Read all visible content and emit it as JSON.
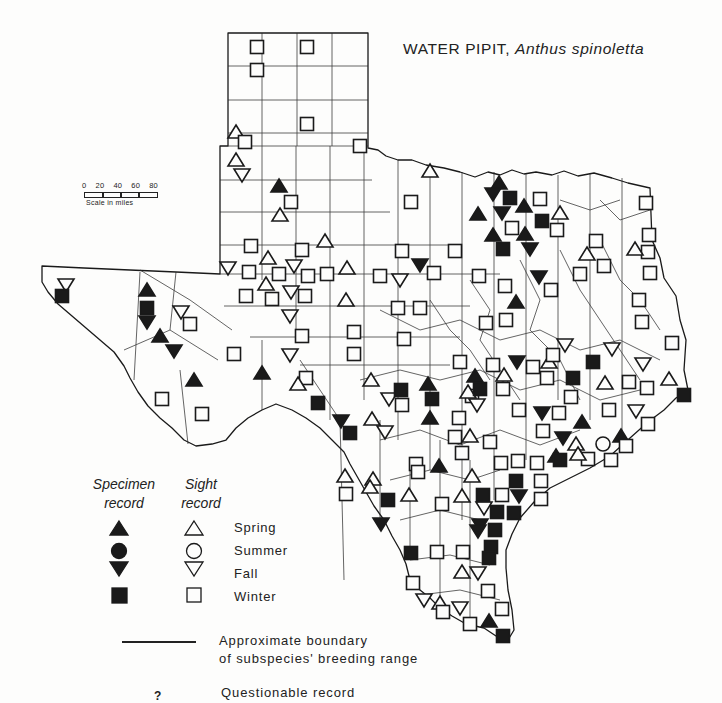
{
  "title": {
    "common_name": "WATER PIPIT,",
    "scientific_name": "Anthus spinoletta"
  },
  "scale": {
    "ticks": [
      "0",
      "20",
      "40",
      "60",
      "80"
    ],
    "label": "Scale in miles"
  },
  "legend": {
    "column_headers": {
      "specimen": [
        "Specimen",
        "record"
      ],
      "sight": [
        "Sight",
        "record"
      ]
    },
    "seasons": [
      {
        "label": "Spring",
        "shape": "triangle-up"
      },
      {
        "label": "Summer",
        "shape": "circle"
      },
      {
        "label": "Fall",
        "shape": "triangle-down"
      },
      {
        "label": "Winter",
        "shape": "square"
      }
    ],
    "boundary_text": [
      "Approximate boundary",
      "of subspecies' breeding range"
    ],
    "questionable_symbol": "?",
    "questionable_text": "Questionable record"
  },
  "colors": {
    "ink": "#1a1a1a",
    "paper": "#fdfdfc"
  },
  "markers": [
    {
      "x": 257,
      "y": 47,
      "shape": "square",
      "filled": false
    },
    {
      "x": 307,
      "y": 47,
      "shape": "square",
      "filled": false
    },
    {
      "x": 257,
      "y": 70,
      "shape": "square",
      "filled": false
    },
    {
      "x": 307,
      "y": 124,
      "shape": "square",
      "filled": false
    },
    {
      "x": 236,
      "y": 132,
      "shape": "triangle-up",
      "filled": false
    },
    {
      "x": 245,
      "y": 142,
      "shape": "square",
      "filled": false
    },
    {
      "x": 236,
      "y": 160,
      "shape": "triangle-up",
      "filled": false
    },
    {
      "x": 242,
      "y": 175,
      "shape": "triangle-down",
      "filled": false
    },
    {
      "x": 360,
      "y": 146,
      "shape": "square",
      "filled": false
    },
    {
      "x": 279,
      "y": 186,
      "shape": "triangle-up",
      "filled": true
    },
    {
      "x": 291,
      "y": 202,
      "shape": "square",
      "filled": false
    },
    {
      "x": 280,
      "y": 215,
      "shape": "triangle-up",
      "filled": false
    },
    {
      "x": 430,
      "y": 171,
      "shape": "triangle-up",
      "filled": false
    },
    {
      "x": 411,
      "y": 202,
      "shape": "square",
      "filled": false
    },
    {
      "x": 499,
      "y": 183,
      "shape": "triangle-up",
      "filled": true
    },
    {
      "x": 493,
      "y": 194,
      "shape": "triangle-down",
      "filled": true
    },
    {
      "x": 510,
      "y": 198,
      "shape": "square",
      "filled": true
    },
    {
      "x": 502,
      "y": 213,
      "shape": "triangle-down",
      "filled": true
    },
    {
      "x": 478,
      "y": 214,
      "shape": "triangle-up",
      "filled": true
    },
    {
      "x": 524,
      "y": 206,
      "shape": "triangle-up",
      "filled": true
    },
    {
      "x": 540,
      "y": 199,
      "shape": "square",
      "filled": false
    },
    {
      "x": 542,
      "y": 221,
      "shape": "square",
      "filled": true
    },
    {
      "x": 560,
      "y": 213,
      "shape": "triangle-up",
      "filled": false
    },
    {
      "x": 512,
      "y": 228,
      "shape": "square",
      "filled": false
    },
    {
      "x": 557,
      "y": 230,
      "shape": "square",
      "filled": false
    },
    {
      "x": 493,
      "y": 235,
      "shape": "triangle-up",
      "filled": true
    },
    {
      "x": 525,
      "y": 234,
      "shape": "triangle-up",
      "filled": true
    },
    {
      "x": 503,
      "y": 249,
      "shape": "square",
      "filled": true
    },
    {
      "x": 530,
      "y": 249,
      "shape": "triangle-down",
      "filled": true
    },
    {
      "x": 646,
      "y": 203,
      "shape": "square",
      "filled": false
    },
    {
      "x": 649,
      "y": 235,
      "shape": "square",
      "filled": false
    },
    {
      "x": 648,
      "y": 252,
      "shape": "square",
      "filled": false
    },
    {
      "x": 635,
      "y": 249,
      "shape": "triangle-up",
      "filled": false
    },
    {
      "x": 596,
      "y": 241,
      "shape": "square",
      "filled": false
    },
    {
      "x": 587,
      "y": 254,
      "shape": "triangle-up",
      "filled": false
    },
    {
      "x": 604,
      "y": 266,
      "shape": "square",
      "filled": false
    },
    {
      "x": 650,
      "y": 273,
      "shape": "square",
      "filled": false
    },
    {
      "x": 580,
      "y": 274,
      "shape": "square",
      "filled": false
    },
    {
      "x": 251,
      "y": 246,
      "shape": "square",
      "filled": false
    },
    {
      "x": 302,
      "y": 250,
      "shape": "square",
      "filled": false
    },
    {
      "x": 325,
      "y": 241,
      "shape": "triangle-up",
      "filled": false
    },
    {
      "x": 402,
      "y": 251,
      "shape": "square",
      "filled": false
    },
    {
      "x": 455,
      "y": 251,
      "shape": "square",
      "filled": false
    },
    {
      "x": 420,
      "y": 265,
      "shape": "triangle-down",
      "filled": true
    },
    {
      "x": 434,
      "y": 273,
      "shape": "square",
      "filled": false
    },
    {
      "x": 228,
      "y": 268,
      "shape": "triangle-down",
      "filled": false
    },
    {
      "x": 249,
      "y": 272,
      "shape": "square",
      "filled": false
    },
    {
      "x": 268,
      "y": 258,
      "shape": "triangle-up",
      "filled": false
    },
    {
      "x": 279,
      "y": 274,
      "shape": "square",
      "filled": false
    },
    {
      "x": 294,
      "y": 266,
      "shape": "triangle-down",
      "filled": false
    },
    {
      "x": 308,
      "y": 276,
      "shape": "square",
      "filled": false
    },
    {
      "x": 327,
      "y": 274,
      "shape": "square",
      "filled": false
    },
    {
      "x": 347,
      "y": 268,
      "shape": "triangle-up",
      "filled": false
    },
    {
      "x": 380,
      "y": 276,
      "shape": "square",
      "filled": false
    },
    {
      "x": 400,
      "y": 280,
      "shape": "triangle-down",
      "filled": false
    },
    {
      "x": 479,
      "y": 276,
      "shape": "square",
      "filled": false
    },
    {
      "x": 505,
      "y": 286,
      "shape": "square",
      "filled": false
    },
    {
      "x": 539,
      "y": 277,
      "shape": "triangle-down",
      "filled": true
    },
    {
      "x": 551,
      "y": 290,
      "shape": "square",
      "filled": false
    },
    {
      "x": 266,
      "y": 284,
      "shape": "triangle-up",
      "filled": false
    },
    {
      "x": 246,
      "y": 296,
      "shape": "square",
      "filled": false
    },
    {
      "x": 272,
      "y": 299,
      "shape": "square",
      "filled": false
    },
    {
      "x": 291,
      "y": 292,
      "shape": "triangle-down",
      "filled": false
    },
    {
      "x": 305,
      "y": 296,
      "shape": "square",
      "filled": false
    },
    {
      "x": 290,
      "y": 316,
      "shape": "triangle-down",
      "filled": false
    },
    {
      "x": 346,
      "y": 300,
      "shape": "triangle-up",
      "filled": false
    },
    {
      "x": 398,
      "y": 308,
      "shape": "square",
      "filled": false
    },
    {
      "x": 420,
      "y": 308,
      "shape": "square",
      "filled": false
    },
    {
      "x": 516,
      "y": 302,
      "shape": "triangle-up",
      "filled": true
    },
    {
      "x": 486,
      "y": 323,
      "shape": "square",
      "filled": false
    },
    {
      "x": 506,
      "y": 320,
      "shape": "square",
      "filled": false
    },
    {
      "x": 639,
      "y": 300,
      "shape": "square",
      "filled": false
    },
    {
      "x": 642,
      "y": 322,
      "shape": "square",
      "filled": false
    },
    {
      "x": 672,
      "y": 343,
      "shape": "square",
      "filled": false
    },
    {
      "x": 302,
      "y": 336,
      "shape": "square",
      "filled": false
    },
    {
      "x": 354,
      "y": 332,
      "shape": "square",
      "filled": false
    },
    {
      "x": 404,
      "y": 339,
      "shape": "square",
      "filled": false
    },
    {
      "x": 290,
      "y": 355,
      "shape": "triangle-down",
      "filled": false
    },
    {
      "x": 354,
      "y": 354,
      "shape": "square",
      "filled": false
    },
    {
      "x": 66,
      "y": 285,
      "shape": "triangle-down",
      "filled": false
    },
    {
      "x": 62,
      "y": 296,
      "shape": "square",
      "filled": true
    },
    {
      "x": 147,
      "y": 290,
      "shape": "triangle-up",
      "filled": true
    },
    {
      "x": 147,
      "y": 308,
      "shape": "square",
      "filled": true
    },
    {
      "x": 147,
      "y": 322,
      "shape": "triangle-down",
      "filled": true
    },
    {
      "x": 160,
      "y": 336,
      "shape": "triangle-up",
      "filled": true
    },
    {
      "x": 174,
      "y": 351,
      "shape": "triangle-down",
      "filled": true
    },
    {
      "x": 181,
      "y": 312,
      "shape": "triangle-down",
      "filled": false
    },
    {
      "x": 190,
      "y": 324,
      "shape": "square",
      "filled": false
    },
    {
      "x": 194,
      "y": 380,
      "shape": "triangle-up",
      "filled": true
    },
    {
      "x": 162,
      "y": 399,
      "shape": "square",
      "filled": false
    },
    {
      "x": 202,
      "y": 414,
      "shape": "square",
      "filled": false
    },
    {
      "x": 234,
      "y": 354,
      "shape": "square",
      "filled": false
    },
    {
      "x": 262,
      "y": 373,
      "shape": "triangle-up",
      "filled": true
    },
    {
      "x": 306,
      "y": 378,
      "shape": "square",
      "filled": false
    },
    {
      "x": 298,
      "y": 384,
      "shape": "triangle-up",
      "filled": false
    },
    {
      "x": 318,
      "y": 403,
      "shape": "square",
      "filled": true
    },
    {
      "x": 371,
      "y": 380,
      "shape": "triangle-up",
      "filled": false
    },
    {
      "x": 389,
      "y": 399,
      "shape": "triangle-down",
      "filled": false
    },
    {
      "x": 401,
      "y": 390,
      "shape": "square",
      "filled": true
    },
    {
      "x": 428,
      "y": 384,
      "shape": "triangle-up",
      "filled": true
    },
    {
      "x": 432,
      "y": 399,
      "shape": "square",
      "filled": true
    },
    {
      "x": 402,
      "y": 405,
      "shape": "square",
      "filled": false
    },
    {
      "x": 341,
      "y": 421,
      "shape": "triangle-down",
      "filled": true
    },
    {
      "x": 372,
      "y": 419,
      "shape": "triangle-up",
      "filled": false
    },
    {
      "x": 350,
      "y": 433,
      "shape": "square",
      "filled": true
    },
    {
      "x": 385,
      "y": 432,
      "shape": "triangle-down",
      "filled": false
    },
    {
      "x": 430,
      "y": 418,
      "shape": "triangle-up",
      "filled": true
    },
    {
      "x": 459,
      "y": 418,
      "shape": "square",
      "filled": false
    },
    {
      "x": 472,
      "y": 396,
      "shape": "square",
      "filled": false
    },
    {
      "x": 468,
      "y": 392,
      "shape": "triangle-up",
      "filled": false
    },
    {
      "x": 477,
      "y": 405,
      "shape": "triangle-down",
      "filled": false
    },
    {
      "x": 460,
      "y": 362,
      "shape": "square",
      "filled": false
    },
    {
      "x": 475,
      "y": 376,
      "shape": "triangle-up",
      "filled": true
    },
    {
      "x": 480,
      "y": 389,
      "shape": "square",
      "filled": true
    },
    {
      "x": 493,
      "y": 365,
      "shape": "square",
      "filled": false
    },
    {
      "x": 503,
      "y": 389,
      "shape": "square",
      "filled": false
    },
    {
      "x": 504,
      "y": 375,
      "shape": "triangle-up",
      "filled": false
    },
    {
      "x": 517,
      "y": 362,
      "shape": "triangle-down",
      "filled": true
    },
    {
      "x": 533,
      "y": 367,
      "shape": "square",
      "filled": false
    },
    {
      "x": 549,
      "y": 362,
      "shape": "triangle-up",
      "filled": false
    },
    {
      "x": 547,
      "y": 378,
      "shape": "square",
      "filled": false
    },
    {
      "x": 553,
      "y": 355,
      "shape": "square",
      "filled": false
    },
    {
      "x": 565,
      "y": 345,
      "shape": "triangle-down",
      "filled": false
    },
    {
      "x": 573,
      "y": 378,
      "shape": "square",
      "filled": true
    },
    {
      "x": 571,
      "y": 397,
      "shape": "square",
      "filled": false
    },
    {
      "x": 593,
      "y": 362,
      "shape": "square",
      "filled": true
    },
    {
      "x": 605,
      "y": 383,
      "shape": "triangle-up",
      "filled": false
    },
    {
      "x": 612,
      "y": 349,
      "shape": "triangle-down",
      "filled": false
    },
    {
      "x": 629,
      "y": 382,
      "shape": "square",
      "filled": false
    },
    {
      "x": 643,
      "y": 364,
      "shape": "triangle-down",
      "filled": false
    },
    {
      "x": 647,
      "y": 388,
      "shape": "square",
      "filled": false
    },
    {
      "x": 669,
      "y": 379,
      "shape": "triangle-up",
      "filled": false
    },
    {
      "x": 684,
      "y": 395,
      "shape": "square",
      "filled": true
    },
    {
      "x": 609,
      "y": 410,
      "shape": "square",
      "filled": false
    },
    {
      "x": 636,
      "y": 411,
      "shape": "triangle-down",
      "filled": false
    },
    {
      "x": 648,
      "y": 424,
      "shape": "square",
      "filled": false
    },
    {
      "x": 519,
      "y": 410,
      "shape": "square",
      "filled": false
    },
    {
      "x": 542,
      "y": 413,
      "shape": "triangle-down",
      "filled": true
    },
    {
      "x": 559,
      "y": 413,
      "shape": "square",
      "filled": false
    },
    {
      "x": 582,
      "y": 422,
      "shape": "triangle-up",
      "filled": true
    },
    {
      "x": 543,
      "y": 431,
      "shape": "square",
      "filled": false
    },
    {
      "x": 563,
      "y": 438,
      "shape": "triangle-down",
      "filled": true
    },
    {
      "x": 576,
      "y": 444,
      "shape": "triangle-up",
      "filled": false
    },
    {
      "x": 603,
      "y": 444,
      "shape": "circle",
      "filled": false
    },
    {
      "x": 621,
      "y": 436,
      "shape": "triangle-up",
      "filled": true
    },
    {
      "x": 626,
      "y": 446,
      "shape": "square",
      "filled": false
    },
    {
      "x": 588,
      "y": 459,
      "shape": "square",
      "filled": false
    },
    {
      "x": 578,
      "y": 454,
      "shape": "triangle-up",
      "filled": false
    },
    {
      "x": 611,
      "y": 460,
      "shape": "square",
      "filled": false
    },
    {
      "x": 455,
      "y": 437,
      "shape": "square",
      "filled": false
    },
    {
      "x": 470,
      "y": 436,
      "shape": "triangle-up",
      "filled": false
    },
    {
      "x": 490,
      "y": 442,
      "shape": "square",
      "filled": false
    },
    {
      "x": 462,
      "y": 453,
      "shape": "square",
      "filled": false
    },
    {
      "x": 439,
      "y": 466,
      "shape": "triangle-up",
      "filled": true
    },
    {
      "x": 416,
      "y": 464,
      "shape": "square",
      "filled": false
    },
    {
      "x": 501,
      "y": 463,
      "shape": "square",
      "filled": false
    },
    {
      "x": 518,
      "y": 461,
      "shape": "square",
      "filled": false
    },
    {
      "x": 537,
      "y": 463,
      "shape": "square",
      "filled": false
    },
    {
      "x": 556,
      "y": 456,
      "shape": "triangle-up",
      "filled": true
    },
    {
      "x": 560,
      "y": 460,
      "shape": "square",
      "filled": true
    },
    {
      "x": 541,
      "y": 481,
      "shape": "square",
      "filled": false
    },
    {
      "x": 516,
      "y": 481,
      "shape": "square",
      "filled": true
    },
    {
      "x": 472,
      "y": 476,
      "shape": "triangle-up",
      "filled": false
    },
    {
      "x": 519,
      "y": 496,
      "shape": "triangle-down",
      "filled": true
    },
    {
      "x": 502,
      "y": 495,
      "shape": "square",
      "filled": false
    },
    {
      "x": 541,
      "y": 499,
      "shape": "square",
      "filled": false
    },
    {
      "x": 484,
      "y": 508,
      "shape": "triangle-down",
      "filled": false
    },
    {
      "x": 483,
      "y": 495,
      "shape": "square",
      "filled": true
    },
    {
      "x": 497,
      "y": 512,
      "shape": "square",
      "filled": true
    },
    {
      "x": 514,
      "y": 513,
      "shape": "square",
      "filled": true
    },
    {
      "x": 480,
      "y": 525,
      "shape": "triangle-down",
      "filled": true
    },
    {
      "x": 495,
      "y": 530,
      "shape": "square",
      "filled": true
    },
    {
      "x": 491,
      "y": 547,
      "shape": "square",
      "filled": true
    },
    {
      "x": 478,
      "y": 531,
      "shape": "triangle-down",
      "filled": true
    },
    {
      "x": 489,
      "y": 558,
      "shape": "square",
      "filled": true
    },
    {
      "x": 345,
      "y": 476,
      "shape": "triangle-up",
      "filled": false
    },
    {
      "x": 373,
      "y": 479,
      "shape": "triangle-up",
      "filled": false
    },
    {
      "x": 346,
      "y": 494,
      "shape": "square",
      "filled": false
    },
    {
      "x": 370,
      "y": 487,
      "shape": "triangle-up",
      "filled": false
    },
    {
      "x": 388,
      "y": 500,
      "shape": "square",
      "filled": true
    },
    {
      "x": 409,
      "y": 495,
      "shape": "triangle-up",
      "filled": false
    },
    {
      "x": 418,
      "y": 472,
      "shape": "square",
      "filled": false
    },
    {
      "x": 381,
      "y": 524,
      "shape": "triangle-down",
      "filled": true
    },
    {
      "x": 442,
      "y": 504,
      "shape": "square",
      "filled": false
    },
    {
      "x": 462,
      "y": 496,
      "shape": "triangle-up",
      "filled": false
    },
    {
      "x": 411,
      "y": 553,
      "shape": "square",
      "filled": true
    },
    {
      "x": 437,
      "y": 552,
      "shape": "square",
      "filled": false
    },
    {
      "x": 463,
      "y": 552,
      "shape": "square",
      "filled": false
    },
    {
      "x": 462,
      "y": 572,
      "shape": "triangle-up",
      "filled": false
    },
    {
      "x": 478,
      "y": 573,
      "shape": "triangle-down",
      "filled": false
    },
    {
      "x": 413,
      "y": 583,
      "shape": "square",
      "filled": false
    },
    {
      "x": 488,
      "y": 591,
      "shape": "square",
      "filled": false
    },
    {
      "x": 424,
      "y": 600,
      "shape": "triangle-down",
      "filled": false
    },
    {
      "x": 440,
      "y": 603,
      "shape": "triangle-up",
      "filled": false
    },
    {
      "x": 443,
      "y": 612,
      "shape": "square",
      "filled": false
    },
    {
      "x": 460,
      "y": 608,
      "shape": "triangle-down",
      "filled": false
    },
    {
      "x": 470,
      "y": 624,
      "shape": "square",
      "filled": false
    },
    {
      "x": 502,
      "y": 609,
      "shape": "square",
      "filled": false
    },
    {
      "x": 489,
      "y": 621,
      "shape": "triangle-up",
      "filled": true
    },
    {
      "x": 503,
      "y": 636,
      "shape": "square",
      "filled": true
    }
  ]
}
